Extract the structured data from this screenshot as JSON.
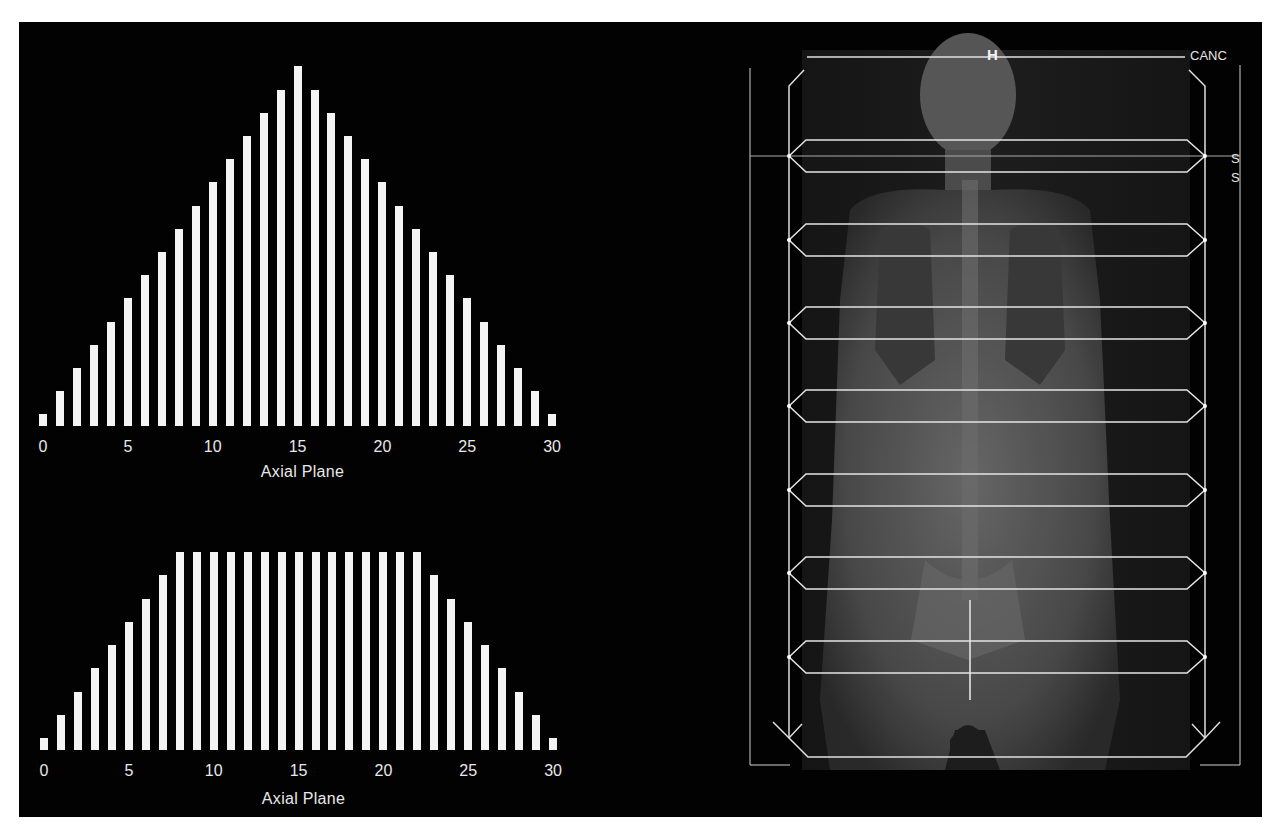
{
  "chart_data": [
    {
      "type": "bar",
      "title": "",
      "xlabel": "Axial Plane",
      "ylabel": "",
      "x": [
        0,
        1,
        2,
        3,
        4,
        5,
        6,
        7,
        8,
        9,
        10,
        11,
        12,
        13,
        14,
        15,
        16,
        17,
        18,
        19,
        20,
        21,
        22,
        23,
        24,
        25,
        26,
        27,
        28,
        29,
        30
      ],
      "values": [
        1,
        3,
        5,
        7,
        9,
        11,
        13,
        15,
        17,
        19,
        21,
        23,
        25,
        27,
        29,
        31,
        29,
        27,
        25,
        23,
        21,
        19,
        17,
        15,
        13,
        11,
        9,
        7,
        5,
        3,
        1
      ],
      "xticks": [
        "0",
        "5",
        "10",
        "15",
        "20",
        "25",
        "30"
      ],
      "xlim": [
        0,
        30
      ],
      "grid": false,
      "legend": null,
      "note": "relative bar heights (no y-axis shown); triangular profile peaking at plane 15"
    },
    {
      "type": "bar",
      "title": "",
      "xlabel": "Axial Plane",
      "ylabel": "",
      "x": [
        0,
        1,
        2,
        3,
        4,
        5,
        6,
        7,
        8,
        9,
        10,
        11,
        12,
        13,
        14,
        15,
        16,
        17,
        18,
        19,
        20,
        21,
        22,
        23,
        24,
        25,
        26,
        27,
        28,
        29,
        30
      ],
      "values": [
        1,
        3,
        5,
        7,
        9,
        11,
        13,
        15,
        17,
        17,
        17,
        17,
        17,
        17,
        17,
        17,
        17,
        17,
        17,
        17,
        17,
        17,
        17,
        15,
        13,
        11,
        9,
        7,
        5,
        3,
        1
      ],
      "xticks": [
        "0",
        "5",
        "10",
        "15",
        "20",
        "25",
        "30"
      ],
      "xlim": [
        0,
        30
      ],
      "grid": false,
      "legend": null,
      "note": "relative bar heights (no y-axis shown); trapezoidal profile with plateau from plane 8 to 22"
    }
  ],
  "charts": {
    "top": {
      "xlabel": "Axial Plane",
      "ticks": [
        "0",
        "5",
        "10",
        "15",
        "20",
        "25",
        "30"
      ]
    },
    "bottom": {
      "xlabel": "Axial Plane",
      "ticks": [
        "0",
        "5",
        "10",
        "15",
        "20",
        "25",
        "30"
      ]
    }
  },
  "scout": {
    "head_marker": "H",
    "corner_text": "CANC",
    "side_labels": [
      "S",
      "S"
    ],
    "bed_positions": 7
  },
  "colors": {
    "background": "#020202",
    "bars": "#f4f4f4",
    "text": "#e8e8e8",
    "overlay_lines": "#d8d8d8"
  }
}
